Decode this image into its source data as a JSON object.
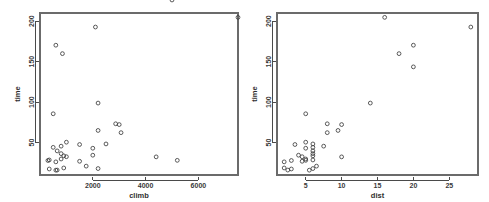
{
  "figure": {
    "background_color": "#ffffff",
    "point_color": "#3d3d3d",
    "axis_color": "#4a4a4a",
    "frame_color": "#6b6b6b",
    "panel_count": 2
  },
  "chart_data": [
    {
      "type": "scatter",
      "title": "",
      "xlabel": "climb",
      "ylabel": "time",
      "xlim": [
        0,
        7500
      ],
      "ylim": [
        10,
        210
      ],
      "xticks": [
        2000,
        4000,
        6000
      ],
      "xticklabels": [
        "2000",
        "4000",
        "6000"
      ],
      "yticks": [
        50,
        100,
        150,
        200
      ],
      "yticklabels": [
        "50",
        "100",
        "150",
        "200"
      ],
      "grid": false,
      "legend": "none",
      "marker": "open-circle",
      "x": [
        650,
        2500,
        900,
        800,
        3070,
        2866,
        7500,
        800,
        800,
        650,
        2100,
        2000,
        2200,
        500,
        1500,
        3000,
        2200,
        350,
        1000,
        600,
        300,
        1500,
        2200,
        900,
        600,
        2000,
        350,
        1000,
        1750,
        500,
        4400,
        600,
        5200,
        850,
        5000
      ],
      "y": [
        16.083,
        48.35,
        33.65,
        45.6,
        62.267,
        73.217,
        204.617,
        36.367,
        29.75,
        39.75,
        192.667,
        43.05,
        65,
        44.133,
        26.933,
        72.25,
        98.8,
        17.417,
        32.567,
        15.95,
        27.9,
        47.633,
        17.933,
        18.683,
        26.217,
        34.433,
        28.567,
        50.5,
        20.95,
        85.583,
        32.383,
        170.25,
        28.1,
        159.833
      ],
      "n_points": 35
    },
    {
      "type": "scatter",
      "title": "",
      "xlabel": "dist",
      "ylabel": "time",
      "xlim": [
        1,
        29
      ],
      "ylim": [
        10,
        210
      ],
      "xticks": [
        5,
        10,
        15,
        20,
        25
      ],
      "xticklabels": [
        "5",
        "10",
        "15",
        "20",
        "25"
      ],
      "yticks": [
        50,
        100,
        150,
        200
      ],
      "yticklabels": [
        "50",
        "100",
        "150",
        "200"
      ],
      "grid": false,
      "legend": "none",
      "marker": "open-circle",
      "x": [
        2.5,
        6,
        6,
        7.5,
        8,
        8,
        16,
        6,
        5,
        6,
        28,
        5,
        9.5,
        6,
        4.5,
        10,
        14,
        3,
        4.5,
        5.5,
        3,
        3.5,
        6,
        2,
        2,
        4,
        6,
        5,
        6.5,
        5,
        10,
        20,
        5,
        18,
        20
      ],
      "y": [
        16.083,
        48.35,
        33.65,
        45.6,
        62.267,
        73.217,
        204.617,
        36.367,
        29.75,
        39.75,
        192.667,
        43.05,
        65,
        44.133,
        26.933,
        72.25,
        98.8,
        17.417,
        32.567,
        15.95,
        27.9,
        47.633,
        17.933,
        18.683,
        26.217,
        34.433,
        28.567,
        50.5,
        20.95,
        85.583,
        32.383,
        170.25,
        28.1,
        159.833,
        143.5
      ],
      "n_points": 35
    }
  ]
}
